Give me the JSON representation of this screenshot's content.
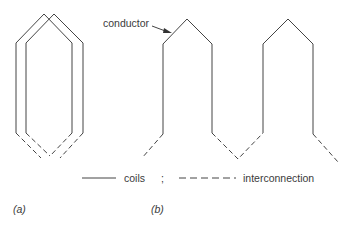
{
  "labels": {
    "conductor": "conductor",
    "legend_coils": "coils",
    "legend_separator": ";",
    "legend_interconnection": "interconnection",
    "panel_a": "(a)",
    "panel_b": "(b)"
  },
  "legend": [
    {
      "style": "solid",
      "meaning": "coils"
    },
    {
      "style": "dashed",
      "meaning": "interconnection"
    }
  ],
  "panels": [
    {
      "id": "a",
      "description": "two overlapping lap-wound coils with dashed interconnections"
    },
    {
      "id": "b",
      "description": "wave-wound coils connected in series by dashed interconnections"
    }
  ],
  "colors": {
    "stroke": "#444444",
    "background": "#ffffff"
  }
}
